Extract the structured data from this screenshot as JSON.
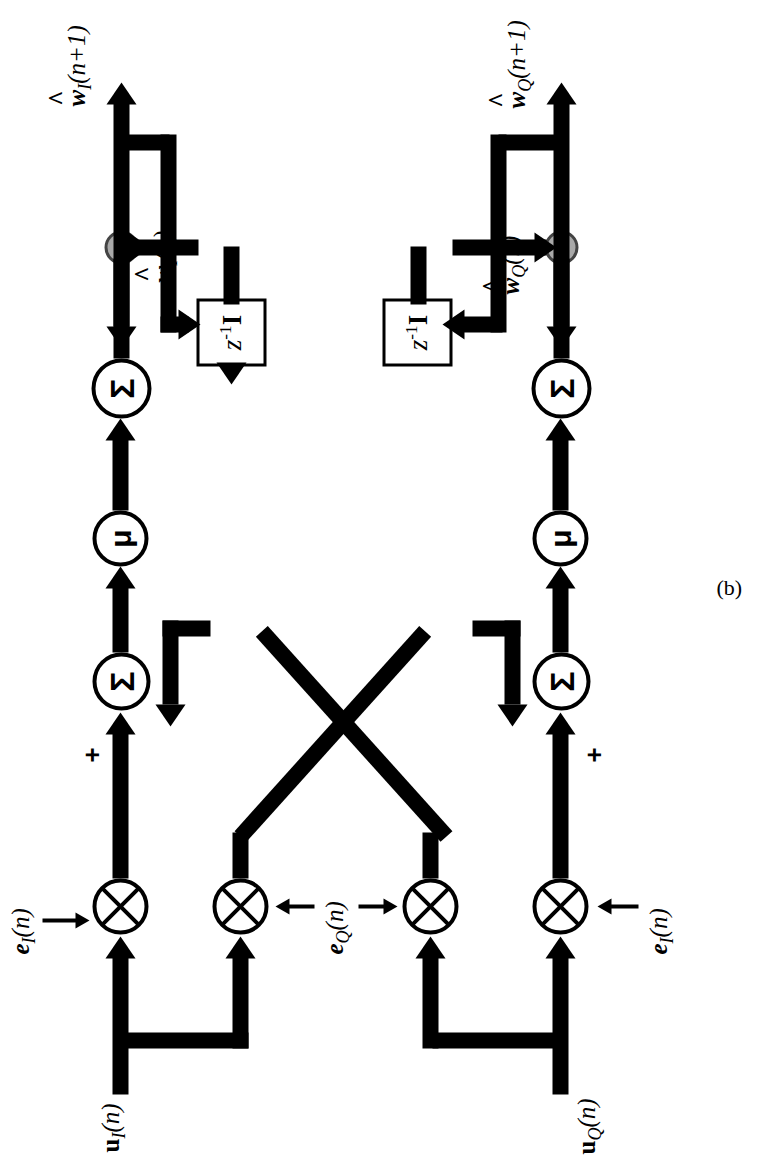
{
  "figure": {
    "caption": "(b)"
  },
  "colors": {
    "line": "#000000",
    "background": "#ffffff",
    "tap_node_fill": "#a9a9a9",
    "block_fill": "#ffffff"
  },
  "channels": {
    "in_phase": {
      "input_label": "u",
      "input_sub": "I",
      "input_arg": "(n)",
      "error_label": "e",
      "error_sub": "I",
      "error_arg": "(n)",
      "weight_out_label": "w",
      "weight_out_sub": "I",
      "weight_out_arg": "(n+1)",
      "weight_state_label": "w",
      "weight_state_sub": "I",
      "weight_state_arg": "(n)"
    },
    "quadrature": {
      "input_label": "u",
      "input_sub": "Q",
      "input_arg": "(n)",
      "error_label": "e",
      "error_sub": "Q",
      "error_arg": "(n)",
      "weight_out_label": "w",
      "weight_out_sub": "Q",
      "weight_out_arg": "(n+1)",
      "weight_state_label": "w",
      "weight_state_sub": "Q",
      "weight_state_arg": "(n)"
    }
  },
  "blocks": {
    "delay_z": "z",
    "delay_exp": "-1",
    "delay_matrix": "I",
    "summer_symbol": "Σ",
    "gain_symbol": "μ",
    "multiplier_symbol": "⊗"
  },
  "signs": {
    "top_adder_left": "+",
    "top_adder_right": "−",
    "bottom_adder_left": "+",
    "bottom_adder_right": "+"
  },
  "labels": {
    "err_in_top": "e_I(n)",
    "err_in_mid": "e_Q(n)",
    "err_in_bottom": "e_I(n)",
    "u_top": "u_I(n)",
    "u_bottom": "u_Q(n)",
    "w_out_top": "w_I(n+1)",
    "w_out_bottom": "w_Q(n+1)",
    "w_state_top": "w_I(n)",
    "w_state_bottom": "w_Q(n)"
  }
}
